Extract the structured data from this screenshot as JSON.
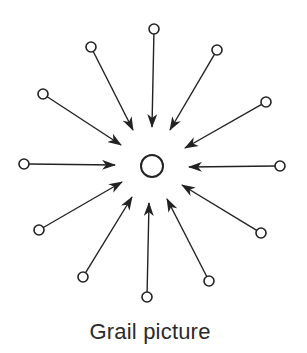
{
  "diagram": {
    "caption": "Grail picture",
    "stroke_color": "#222222",
    "center_node": {
      "x": 152,
      "y": 166,
      "r": 11
    },
    "outer_node_radius": 5,
    "edges": [
      {
        "id": "top",
        "from": [
          154,
          29
        ],
        "to": [
          152,
          127
        ]
      },
      {
        "id": "top-right",
        "from": [
          217,
          50
        ],
        "to": [
          170,
          130
        ]
      },
      {
        "id": "right-upper",
        "from": [
          266,
          102
        ],
        "to": [
          185,
          148
        ]
      },
      {
        "id": "right",
        "from": [
          280,
          166
        ],
        "to": [
          189,
          167
        ]
      },
      {
        "id": "right-lower",
        "from": [
          261,
          233
        ],
        "to": [
          182,
          185
        ]
      },
      {
        "id": "bottom-right",
        "from": [
          209,
          281
        ],
        "to": [
          167,
          199
        ]
      },
      {
        "id": "bottom",
        "from": [
          147,
          297
        ],
        "to": [
          149,
          203
        ]
      },
      {
        "id": "bottom-left",
        "from": [
          83,
          277
        ],
        "to": [
          132,
          197
        ]
      },
      {
        "id": "left-lower",
        "from": [
          39,
          230
        ],
        "to": [
          122,
          182
        ]
      },
      {
        "id": "left",
        "from": [
          24,
          164
        ],
        "to": [
          115,
          165
        ]
      },
      {
        "id": "left-upper",
        "from": [
          43,
          94
        ],
        "to": [
          121,
          145
        ]
      },
      {
        "id": "top-left",
        "from": [
          91,
          47
        ],
        "to": [
          133,
          130
        ]
      }
    ],
    "edge_direction": "inward-toward-center",
    "node_count_outer": 12
  }
}
